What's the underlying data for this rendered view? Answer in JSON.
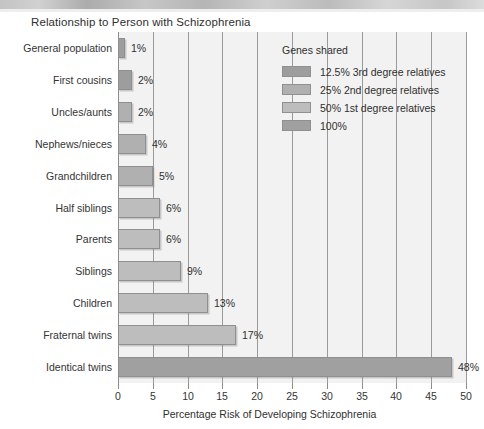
{
  "header": {
    "title": "Relationship to Person with Schizophrenia"
  },
  "chart_data": {
    "type": "bar",
    "orientation": "horizontal",
    "title": "Relationship to Person with Schizophrenia",
    "xlabel": "Percentage Risk of Developing Schizophrenia",
    "ylabel": "",
    "xlim": [
      0,
      50
    ],
    "xticks": [
      0,
      5,
      10,
      15,
      20,
      25,
      30,
      35,
      40,
      45,
      50
    ],
    "xtick_labels": [
      "0",
      "5",
      "10",
      "15",
      "20",
      "25",
      "30",
      "35",
      "40",
      "45",
      "50"
    ],
    "grid": "vertical",
    "legend_position": "inside-top-right",
    "categories": [
      "General population",
      "First cousins",
      "Uncles/aunts",
      "Nephews/nieces",
      "Grandchildren",
      "Half siblings",
      "Parents",
      "Siblings",
      "Children",
      "Fraternal twins",
      "Identical twins"
    ],
    "values": [
      1,
      2,
      2,
      4,
      5,
      6,
      6,
      9,
      13,
      17,
      48
    ],
    "value_labels": [
      "1%",
      "2%",
      "2%",
      "4%",
      "5%",
      "6%",
      "6%",
      "9%",
      "13%",
      "17%",
      "48%"
    ],
    "point_groups": [
      "g125",
      "g125",
      "g25",
      "g25",
      "g25",
      "g50",
      "g50",
      "g50",
      "g50",
      "g50",
      "g100"
    ],
    "colors": {
      "g125": "#9d9d9d",
      "g25": "#b0b0b0",
      "g50": "#bdbdbd",
      "g100": "#a0a0a0",
      "plot_background": "#f2f2f2",
      "gridline": "#9a9a9a",
      "text": "#2f2f2f"
    },
    "legend": {
      "title": "Genes shared",
      "entries": [
        {
          "key": "g125",
          "label": "12.5% 3rd degree relatives",
          "color": "#9d9d9d"
        },
        {
          "key": "g25",
          "label": "25% 2nd degree relatives",
          "color": "#b0b0b0"
        },
        {
          "key": "g50",
          "label": "50% 1st degree relatives",
          "color": "#bdbdbd"
        },
        {
          "key": "g100",
          "label": "100%",
          "color": "#a0a0a0"
        }
      ]
    }
  }
}
